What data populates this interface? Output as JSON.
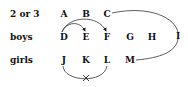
{
  "rows": [
    {
      "label": "2 or 3",
      "nodes": [
        "A",
        "B",
        "C"
      ]
    },
    {
      "label": "boys",
      "nodes": [
        "D",
        "E",
        "F",
        "G",
        "H"
      ]
    },
    {
      "label": "girls",
      "nodes": [
        "J",
        "K",
        "L",
        "M"
      ]
    }
  ],
  "curve_node": "I",
  "edges": [
    {
      "from": "D",
      "to": "E",
      "arrow": true
    },
    {
      "from": "D",
      "to": "F",
      "arrow": true
    },
    {
      "from": "C",
      "to": "M",
      "via": "I"
    },
    {
      "from": "J",
      "to": "L",
      "mark": "x"
    }
  ]
}
